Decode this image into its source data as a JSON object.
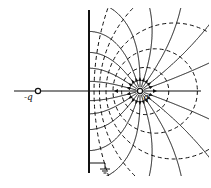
{
  "figure": {
    "width": 211,
    "height": 188,
    "stroke_color": "#111111",
    "background": "#ffffff"
  },
  "plane": {
    "x": 89,
    "y_top": 10,
    "y_bottom": 173,
    "label": "grounded conductor"
  },
  "axis": {
    "y": 91,
    "x_start": 14,
    "x_end": 201
  },
  "charges": [
    {
      "id": "real",
      "label": "q",
      "x": 140,
      "y": 91,
      "label_dx": 3,
      "label_dy": 9
    },
    {
      "id": "image",
      "label": "-q",
      "x": 38,
      "y": 91,
      "label_dx": -14,
      "label_dy": 9
    }
  ],
  "field_lines": {
    "count_half": 9,
    "start_angles_deg": [
      20,
      38,
      55,
      72,
      90,
      108,
      127,
      146,
      165
    ],
    "arrow_frac": 0.12
  },
  "equipotentials": {
    "ratios": [
      0.22,
      0.36,
      0.5,
      0.66,
      0.82
    ]
  },
  "ground": {
    "x": 105,
    "y": 163,
    "label": "ground"
  }
}
